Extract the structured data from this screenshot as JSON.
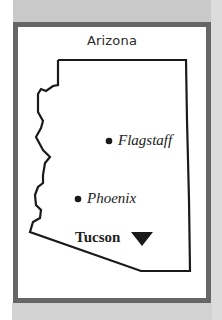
{
  "map": {
    "title": "Arizona",
    "colors": {
      "frame": "#666666",
      "band": "#c9c9c9",
      "outline": "#1a1a1a",
      "marker": "#1a1a1a"
    },
    "cities": [
      {
        "name": "Flagstaff",
        "marker": "dot-icon",
        "style": "italic"
      },
      {
        "name": "Phoenix",
        "marker": "dot-icon",
        "style": "italic"
      },
      {
        "name": "Tucson",
        "marker": "down-triangle-icon",
        "style": "bold"
      }
    ]
  }
}
